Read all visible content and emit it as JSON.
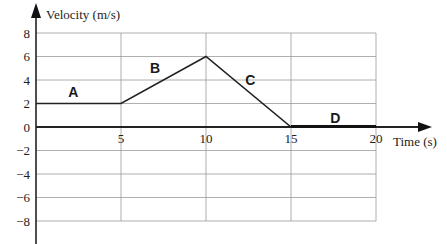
{
  "chart_data": {
    "type": "line",
    "title": "",
    "xlabel": "Time (s)",
    "ylabel": "Velocity (m/s)",
    "xlim": [
      0,
      20
    ],
    "ylim": [
      -9,
      8
    ],
    "x_ticks": [
      5,
      10,
      15,
      20
    ],
    "y_ticks": [
      8,
      6,
      4,
      2,
      0,
      -2,
      -4,
      -6,
      -8
    ],
    "grid": true,
    "legend": null,
    "series": [
      {
        "name": "velocity",
        "x": [
          0,
          5,
          10,
          15,
          20
        ],
        "y": [
          2,
          2,
          6,
          0,
          0
        ]
      }
    ],
    "annotations": [
      {
        "text": "A",
        "x": 2.2,
        "y": 3
      },
      {
        "text": "B",
        "x": 7,
        "y": 5
      },
      {
        "text": "C",
        "x": 12.6,
        "y": 4
      },
      {
        "text": "D",
        "x": 17.6,
        "y": 0.8
      }
    ]
  }
}
